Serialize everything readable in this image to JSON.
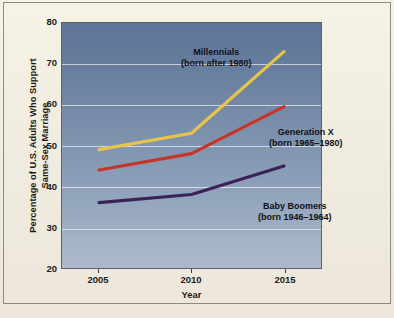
{
  "chart_data": {
    "type": "line",
    "title": "",
    "xlabel": "Year",
    "ylabel": "Percentage of U.S. Adults Who Support Same-Sex Marriage",
    "x": [
      2005,
      2010,
      2015
    ],
    "xticks": [
      "2005",
      "2010",
      "2015"
    ],
    "yticks": [
      "20",
      "30",
      "40",
      "50",
      "60",
      "70",
      "80"
    ],
    "xlim": [
      2003,
      2017
    ],
    "ylim": [
      20,
      80
    ],
    "grid": true,
    "legend_position": "inline-annotations",
    "series": [
      {
        "name": "Millennials",
        "sublabel": "(born after 1980)",
        "color": "#e5c košík"
      }
    ]
  }
}
